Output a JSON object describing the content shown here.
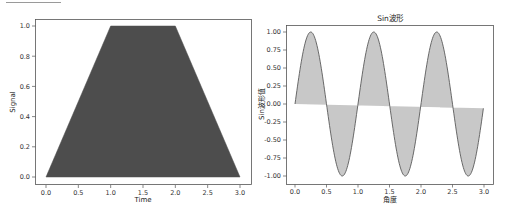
{
  "chart_data": [
    {
      "type": "area",
      "title": "",
      "xlabel": "Time",
      "ylabel": "Signal",
      "x": [
        0.0,
        1.0,
        2.0,
        3.0
      ],
      "values": [
        0.0,
        1.0,
        1.0,
        0.0
      ],
      "xlim": [
        -0.15,
        3.15
      ],
      "ylim": [
        -0.05,
        1.05
      ],
      "xticks": [
        "0.0",
        "0.5",
        "1.0",
        "1.5",
        "2.0",
        "2.5",
        "3.0"
      ],
      "yticks": [
        "0.0",
        "0.2",
        "0.4",
        "0.6",
        "0.8",
        "1.0"
      ],
      "fill_color": "#4d4d4d",
      "grid": false,
      "legend": null
    },
    {
      "type": "area",
      "title": "Sin波形",
      "xlabel": "角度",
      "ylabel": "Sin波形值",
      "function": "y = sin(2*pi*x), x in [0, 2.99]",
      "x": [
        0.0,
        0.25,
        0.5,
        0.75,
        1.0,
        1.25,
        1.5,
        1.75,
        2.0,
        2.25,
        2.5,
        2.75,
        2.99
      ],
      "values": [
        0.0,
        1.0,
        0.0,
        -1.0,
        0.0,
        1.0,
        0.0,
        -1.0,
        0.0,
        1.0,
        0.0,
        -1.0,
        -0.06
      ],
      "xlim": [
        -0.15,
        3.15
      ],
      "ylim": [
        -1.1,
        1.1
      ],
      "xticks": [
        "0.0",
        "0.5",
        "1.0",
        "1.5",
        "2.0",
        "2.5",
        "3.0"
      ],
      "yticks": [
        "-1.00",
        "-0.75",
        "-0.50",
        "-0.25",
        "0.00",
        "0.25",
        "0.50",
        "0.75",
        "1.00"
      ],
      "fill_color": "#c8c8c8",
      "line_color": "#5a5a5a",
      "grid": false,
      "legend": null
    }
  ]
}
